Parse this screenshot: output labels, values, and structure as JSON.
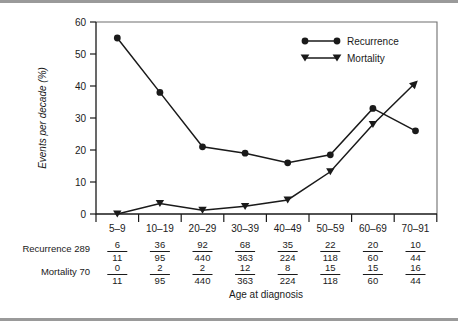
{
  "chart_data": {
    "type": "line",
    "title": "",
    "xlabel": "Age at diagnosis",
    "ylabel": "Events per decade (%)",
    "categories": [
      "5–9",
      "10–19",
      "20–29",
      "30–39",
      "40–49",
      "50–59",
      "60–69",
      "70–91"
    ],
    "ylim": [
      0,
      60
    ],
    "yticks": [
      0,
      10,
      20,
      30,
      40,
      50,
      60
    ],
    "ytick_labels": [
      "0",
      "10",
      "20",
      "30",
      "40",
      "50",
      "60"
    ],
    "grid": false,
    "legend_position": "top-right",
    "series": [
      {
        "name": "Recurrence",
        "marker": "circle",
        "values": [
          55,
          38,
          21,
          19,
          16,
          18.5,
          33,
          26
        ]
      },
      {
        "name": "Mortality",
        "marker": "triangle-down",
        "values": [
          0,
          3.3,
          1.2,
          2.4,
          4.4,
          13.2,
          28,
          41
        ],
        "last_point_arrow": true
      }
    ],
    "annotations": {
      "rows": [
        {
          "label": "Recurrence 289",
          "numerators": [
            "6",
            "36",
            "92",
            "68",
            "35",
            "22",
            "20",
            "10"
          ],
          "denominators": [
            "11",
            "95",
            "440",
            "363",
            "224",
            "118",
            "60",
            "44"
          ]
        },
        {
          "label": "Mortality 70",
          "numerators": [
            "0",
            "2",
            "2",
            "12",
            "8",
            "15",
            "15",
            "16"
          ],
          "denominators": [
            "11",
            "95",
            "440",
            "363",
            "224",
            "118",
            "60",
            "44"
          ]
        }
      ]
    },
    "colors": {
      "series": "#1a1a1a",
      "axis": "#1a1a1a",
      "border": "#6f6f6f",
      "rule": "#9a9a9a",
      "background": "#ffffff"
    }
  },
  "legend": {
    "items": [
      {
        "label": "Recurrence",
        "marker": "circle"
      },
      {
        "label": "Mortality",
        "marker": "triangle-down"
      }
    ]
  },
  "axes": {
    "y_title": "Events per decade (%)",
    "x_title": "Age at diagnosis",
    "y_ticks": [
      "0",
      "10",
      "20",
      "30",
      "40",
      "50",
      "60"
    ],
    "x_ticks": [
      "5–9",
      "10–19",
      "20–29",
      "30–39",
      "40–49",
      "50–59",
      "60–69",
      "70–91"
    ]
  },
  "table": {
    "row1_label": "Recurrence 289",
    "row2_label": "Mortality 70",
    "row1_num": [
      "6",
      "36",
      "92",
      "68",
      "35",
      "22",
      "20",
      "10"
    ],
    "row1_den": [
      "11",
      "95",
      "440",
      "363",
      "224",
      "118",
      "60",
      "44"
    ],
    "row2_num": [
      "0",
      "2",
      "2",
      "12",
      "8",
      "15",
      "15",
      "16"
    ],
    "row2_den": [
      "11",
      "95",
      "440",
      "363",
      "224",
      "118",
      "60",
      "44"
    ]
  }
}
